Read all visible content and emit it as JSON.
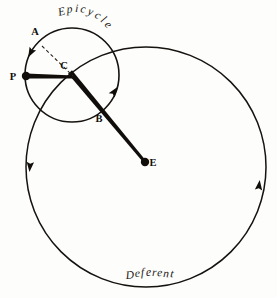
{
  "figure": {
    "background_color": "#fdfdfb",
    "ink_color": "#100d0b"
  },
  "labels": {
    "epicycle": "Epicycle",
    "deferent": "Deferent",
    "point_a": "A",
    "point_b": "B",
    "point_c": "C",
    "point_e": "E",
    "point_p": "P"
  },
  "chart_data": {
    "type": "diagram",
    "circles": [
      {
        "name": "deferent",
        "label": "Deferent",
        "cx": 146,
        "cy": 167,
        "r": 120,
        "stroke_width": 1.5
      },
      {
        "name": "epicycle",
        "label": "Epicycle",
        "cx": 72,
        "cy": 75,
        "r": 47,
        "stroke_width": 1.6
      }
    ],
    "points": [
      {
        "id": "E",
        "label": "E",
        "x": 145,
        "y": 162,
        "marker": "filled-dot",
        "role": "earth-center",
        "label_dx": 8,
        "label_dy": 4
      },
      {
        "id": "C",
        "label": "C",
        "x": 72,
        "y": 75,
        "marker": "none",
        "role": "epicycle-center",
        "label_dx": -8,
        "label_dy": -6
      },
      {
        "id": "P",
        "label": "P",
        "x": 26,
        "y": 76,
        "marker": "filled-dot",
        "role": "planet",
        "label_dx": -13,
        "label_dy": 4
      },
      {
        "id": "A",
        "label": "A",
        "x": 38,
        "y": 41,
        "marker": "none",
        "role": "epicycle-arc-point",
        "label_dx": -3,
        "label_dy": -6
      },
      {
        "id": "B",
        "label": "B",
        "x": 102,
        "y": 112,
        "marker": "none",
        "role": "deferent-crossing",
        "label_dx": -3,
        "label_dy": 10
      }
    ],
    "segments": [
      {
        "name": "planet-radius",
        "from": "P",
        "to": "C",
        "style": "solid-thick",
        "x1": 26,
        "y1": 76,
        "x2": 74,
        "y2": 77
      },
      {
        "name": "center-to-earth",
        "from": "C",
        "to": "E",
        "style": "solid-thick",
        "x1": 70,
        "y1": 72,
        "x2": 145,
        "y2": 162
      },
      {
        "name": "guide-A-to-C",
        "from": "A",
        "to": "C",
        "style": "dashed",
        "x1": 42,
        "y1": 46,
        "x2": 73,
        "y2": 76
      }
    ],
    "arrows": [
      {
        "name": "epicycle-direction",
        "on": "epicycle",
        "x": 31,
        "y": 52,
        "angle_deg": 118,
        "direction": "counterclockwise-down-left"
      },
      {
        "name": "deferent-direction-upper",
        "on": "deferent",
        "x": 114,
        "y": 92,
        "angle_deg": -55,
        "direction": "up-right"
      },
      {
        "name": "deferent-direction-left",
        "on": "deferent",
        "x": 30,
        "y": 166,
        "angle_deg": 95,
        "direction": "down"
      },
      {
        "name": "deferent-direction-right",
        "on": "deferent",
        "x": 259,
        "y": 186,
        "angle_deg": -83,
        "direction": "up"
      }
    ],
    "curved_text": [
      {
        "name": "epicycle-label",
        "text": "Epicycle",
        "path": "arc along upper-right of epicycle circle",
        "chars": [
          {
            "c": "E",
            "x": 59,
            "y": 16,
            "rot": -14
          },
          {
            "c": "p",
            "x": 67,
            "y": 13,
            "rot": -6
          },
          {
            "c": "i",
            "x": 75,
            "y": 12,
            "rot": 2
          },
          {
            "c": "c",
            "x": 80,
            "y": 12,
            "rot": 10
          },
          {
            "c": "y",
            "x": 87,
            "y": 14,
            "rot": 20
          },
          {
            "c": "c",
            "x": 94,
            "y": 17,
            "rot": 30
          },
          {
            "c": "l",
            "x": 100,
            "y": 21,
            "rot": 40
          },
          {
            "c": "e",
            "x": 104,
            "y": 25,
            "rot": 48
          }
        ]
      },
      {
        "name": "deferent-label",
        "text": "Deferent",
        "path": "near bottom of deferent circle, nearly flat",
        "chars": [
          {
            "c": "D",
            "x": 126,
            "y": 279,
            "rot": -5
          },
          {
            "c": "e",
            "x": 135,
            "y": 277,
            "rot": -3
          },
          {
            "c": "f",
            "x": 141,
            "y": 276,
            "rot": -2
          },
          {
            "c": "e",
            "x": 146,
            "y": 276,
            "rot": 0
          },
          {
            "c": "r",
            "x": 152,
            "y": 276,
            "rot": 1
          },
          {
            "c": "e",
            "x": 157,
            "y": 276,
            "rot": 3
          },
          {
            "c": "n",
            "x": 163,
            "y": 277,
            "rot": 4
          },
          {
            "c": "t",
            "x": 170,
            "y": 277,
            "rot": 6
          }
        ]
      }
    ]
  }
}
